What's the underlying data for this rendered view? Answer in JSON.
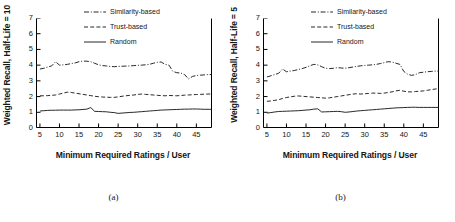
{
  "figure": {
    "panels": [
      {
        "caption": "(a)",
        "chart": {
          "type": "line",
          "title": "",
          "xlabel": "Minimum Required Ratings / User",
          "ylabel": "Weighted Recall, Half-Life = 10",
          "xlim": [
            4,
            49
          ],
          "ylim": [
            0,
            7
          ],
          "xticks": [
            5,
            10,
            15,
            20,
            25,
            30,
            35,
            40,
            45
          ],
          "yticks": [
            0,
            1,
            2,
            3,
            4,
            5,
            6,
            7
          ],
          "grid": false,
          "legend_position": "top-right",
          "x": [
            5,
            6,
            7,
            8,
            9,
            10,
            11,
            12,
            13,
            14,
            15,
            16,
            17,
            18,
            19,
            20,
            21,
            22,
            23,
            24,
            25,
            26,
            27,
            28,
            29,
            30,
            31,
            32,
            33,
            34,
            35,
            36,
            37,
            38,
            39,
            40,
            41,
            42,
            43,
            44,
            45,
            46,
            47,
            48,
            49
          ],
          "series": [
            {
              "name": "Similarity-based",
              "style": "dashdot",
              "values": [
                3.75,
                3.8,
                3.88,
                3.95,
                4.22,
                4.0,
                4.02,
                4.05,
                4.1,
                4.14,
                4.22,
                4.26,
                4.25,
                4.22,
                4.12,
                4.02,
                3.97,
                3.95,
                3.92,
                3.9,
                3.92,
                3.93,
                3.94,
                3.95,
                3.97,
                3.99,
                4.0,
                4.02,
                4.05,
                4.12,
                4.18,
                4.2,
                4.05,
                4.0,
                3.6,
                3.52,
                3.5,
                3.4,
                3.12,
                3.28,
                3.34,
                3.36,
                3.38,
                3.4,
                3.4
              ]
            },
            {
              "name": "Trust-based",
              "style": "dashed",
              "values": [
                2.05,
                2.05,
                2.06,
                2.08,
                2.1,
                2.16,
                2.22,
                2.28,
                2.26,
                2.22,
                2.18,
                2.14,
                2.1,
                2.06,
                2.02,
                1.99,
                1.97,
                1.96,
                1.95,
                1.95,
                1.98,
                2.02,
                2.05,
                2.08,
                2.1,
                2.14,
                2.16,
                2.14,
                2.12,
                2.1,
                2.08,
                2.06,
                2.05,
                2.07,
                2.06,
                2.05,
                2.07,
                2.09,
                2.1,
                2.12,
                2.13,
                2.14,
                2.15,
                2.16,
                2.17
              ]
            },
            {
              "name": "Random",
              "style": "solid",
              "values": [
                1.08,
                1.1,
                1.12,
                1.13,
                1.13,
                1.14,
                1.14,
                1.14,
                1.14,
                1.15,
                1.16,
                1.18,
                1.2,
                1.3,
                1.06,
                1.05,
                1.04,
                1.03,
                1.0,
                0.98,
                0.93,
                0.95,
                0.97,
                0.99,
                1.0,
                1.02,
                1.04,
                1.06,
                1.08,
                1.1,
                1.12,
                1.14,
                1.15,
                1.16,
                1.17,
                1.18,
                1.19,
                1.2,
                1.2,
                1.21,
                1.21,
                1.2,
                1.19,
                1.19,
                1.19
              ]
            }
          ]
        }
      },
      {
        "caption": "(b)",
        "chart": {
          "type": "line",
          "title": "",
          "xlabel": "Minimum Required Ratings / User",
          "ylabel": "Weighted Recall, Half-Life = 5",
          "xlim": [
            4,
            49
          ],
          "ylim": [
            0,
            7
          ],
          "xticks": [
            5,
            10,
            15,
            20,
            25,
            30,
            35,
            40,
            45
          ],
          "yticks": [
            0,
            1,
            2,
            3,
            4,
            5,
            6,
            7
          ],
          "grid": false,
          "legend_position": "top-right",
          "x": [
            5,
            6,
            7,
            8,
            9,
            10,
            11,
            12,
            13,
            14,
            15,
            16,
            17,
            18,
            19,
            20,
            21,
            22,
            23,
            24,
            25,
            26,
            27,
            28,
            29,
            30,
            31,
            32,
            33,
            34,
            35,
            36,
            37,
            38,
            39,
            40,
            41,
            42,
            43,
            44,
            45,
            46,
            47,
            48,
            49
          ],
          "series": [
            {
              "name": "Similarity-based",
              "style": "dashdot",
              "values": [
                3.25,
                3.32,
                3.4,
                3.48,
                3.75,
                3.58,
                3.62,
                3.66,
                3.72,
                3.78,
                3.86,
                3.96,
                4.05,
                4.02,
                3.9,
                3.8,
                3.78,
                3.8,
                3.84,
                3.82,
                3.8,
                3.84,
                3.88,
                3.92,
                3.96,
                3.98,
                4.0,
                4.02,
                4.05,
                4.1,
                4.16,
                4.22,
                4.2,
                4.12,
                4.05,
                3.6,
                3.42,
                3.35,
                3.4,
                3.52,
                3.55,
                3.58,
                3.6,
                3.62,
                3.62
              ]
            },
            {
              "name": "Trust-based",
              "style": "dashed",
              "values": [
                1.7,
                1.72,
                1.76,
                1.8,
                1.88,
                1.94,
                1.98,
                2.02,
                2.04,
                2.02,
                2.0,
                1.98,
                1.96,
                1.94,
                1.92,
                1.9,
                1.92,
                1.96,
                2.0,
                2.04,
                2.08,
                2.12,
                2.16,
                2.18,
                2.16,
                2.18,
                2.2,
                2.22,
                2.22,
                2.2,
                2.22,
                2.26,
                2.3,
                2.36,
                2.4,
                2.34,
                2.3,
                2.3,
                2.32,
                2.34,
                2.36,
                2.4,
                2.44,
                2.48,
                2.5
              ]
            },
            {
              "name": "Random",
              "style": "solid",
              "values": [
                0.95,
                0.98,
                1.02,
                1.05,
                1.06,
                1.07,
                1.08,
                1.09,
                1.1,
                1.12,
                1.14,
                1.16,
                1.2,
                1.22,
                1.02,
                1.03,
                1.04,
                1.05,
                1.06,
                1.04,
                1.0,
                1.02,
                1.05,
                1.08,
                1.1,
                1.12,
                1.14,
                1.16,
                1.18,
                1.2,
                1.22,
                1.24,
                1.26,
                1.28,
                1.29,
                1.3,
                1.31,
                1.32,
                1.32,
                1.31,
                1.31,
                1.31,
                1.31,
                1.31,
                1.31
              ]
            }
          ]
        }
      }
    ]
  },
  "chart_data": [
    {
      "type": "line",
      "title": "(a) Weighted Recall, Half-Life = 10",
      "xlabel": "Minimum Required Ratings / User",
      "ylabel": "Weighted Recall, Half-Life = 10",
      "xlim": [
        4,
        49
      ],
      "ylim": [
        0,
        7
      ],
      "xticks": [
        5,
        10,
        15,
        20,
        25,
        30,
        35,
        40,
        45
      ],
      "yticks": [
        0,
        1,
        2,
        3,
        4,
        5,
        6,
        7
      ],
      "grid": false,
      "legend_position": "top-right",
      "x": [
        5,
        6,
        7,
        8,
        9,
        10,
        11,
        12,
        13,
        14,
        15,
        16,
        17,
        18,
        19,
        20,
        21,
        22,
        23,
        24,
        25,
        26,
        27,
        28,
        29,
        30,
        31,
        32,
        33,
        34,
        35,
        36,
        37,
        38,
        39,
        40,
        41,
        42,
        43,
        44,
        45,
        46,
        47,
        48,
        49
      ],
      "series": [
        {
          "name": "Similarity-based",
          "values": [
            3.75,
            3.8,
            3.88,
            3.95,
            4.22,
            4.0,
            4.02,
            4.05,
            4.1,
            4.14,
            4.22,
            4.26,
            4.25,
            4.22,
            4.12,
            4.02,
            3.97,
            3.95,
            3.92,
            3.9,
            3.92,
            3.93,
            3.94,
            3.95,
            3.97,
            3.99,
            4.0,
            4.02,
            4.05,
            4.12,
            4.18,
            4.2,
            4.05,
            4.0,
            3.6,
            3.52,
            3.5,
            3.4,
            3.12,
            3.28,
            3.34,
            3.36,
            3.38,
            3.4,
            3.4
          ]
        },
        {
          "name": "Trust-based",
          "values": [
            2.05,
            2.05,
            2.06,
            2.08,
            2.1,
            2.16,
            2.22,
            2.28,
            2.26,
            2.22,
            2.18,
            2.14,
            2.1,
            2.06,
            2.02,
            1.99,
            1.97,
            1.96,
            1.95,
            1.95,
            1.98,
            2.02,
            2.05,
            2.08,
            2.1,
            2.14,
            2.16,
            2.14,
            2.12,
            2.1,
            2.08,
            2.06,
            2.05,
            2.07,
            2.06,
            2.05,
            2.07,
            2.09,
            2.1,
            2.12,
            2.13,
            2.14,
            2.15,
            2.16,
            2.17
          ]
        },
        {
          "name": "Random",
          "values": [
            1.08,
            1.1,
            1.12,
            1.13,
            1.13,
            1.14,
            1.14,
            1.14,
            1.14,
            1.15,
            1.16,
            1.18,
            1.2,
            1.3,
            1.06,
            1.05,
            1.04,
            1.03,
            1.0,
            0.98,
            0.93,
            0.95,
            0.97,
            0.99,
            1.0,
            1.02,
            1.04,
            1.06,
            1.08,
            1.1,
            1.12,
            1.14,
            1.15,
            1.16,
            1.17,
            1.18,
            1.19,
            1.2,
            1.2,
            1.21,
            1.21,
            1.2,
            1.19,
            1.19,
            1.19
          ]
        }
      ]
    },
    {
      "type": "line",
      "title": "(b) Weighted Recall, Half-Life = 5",
      "xlabel": "Minimum Required Ratings / User",
      "ylabel": "Weighted Recall, Half-Life = 5",
      "xlim": [
        4,
        49
      ],
      "ylim": [
        0,
        7
      ],
      "xticks": [
        5,
        10,
        15,
        20,
        25,
        30,
        35,
        40,
        45
      ],
      "yticks": [
        0,
        1,
        2,
        3,
        4,
        5,
        6,
        7
      ],
      "grid": false,
      "legend_position": "top-right",
      "x": [
        5,
        6,
        7,
        8,
        9,
        10,
        11,
        12,
        13,
        14,
        15,
        16,
        17,
        18,
        19,
        20,
        21,
        22,
        23,
        24,
        25,
        26,
        27,
        28,
        29,
        30,
        31,
        32,
        33,
        34,
        35,
        36,
        37,
        38,
        39,
        40,
        41,
        42,
        43,
        44,
        45,
        46,
        47,
        48,
        49
      ],
      "series": [
        {
          "name": "Similarity-based",
          "values": [
            3.25,
            3.32,
            3.4,
            3.48,
            3.75,
            3.58,
            3.62,
            3.66,
            3.72,
            3.78,
            3.86,
            3.96,
            4.05,
            4.02,
            3.9,
            3.8,
            3.78,
            3.8,
            3.84,
            3.82,
            3.8,
            3.84,
            3.88,
            3.92,
            3.96,
            3.98,
            4.0,
            4.02,
            4.05,
            4.1,
            4.16,
            4.22,
            4.2,
            4.12,
            4.05,
            3.6,
            3.42,
            3.35,
            3.4,
            3.52,
            3.55,
            3.58,
            3.6,
            3.62,
            3.62
          ]
        },
        {
          "name": "Trust-based",
          "values": [
            1.7,
            1.72,
            1.76,
            1.8,
            1.88,
            1.94,
            1.98,
            2.02,
            2.04,
            2.02,
            2.0,
            1.98,
            1.96,
            1.94,
            1.92,
            1.9,
            1.92,
            1.96,
            2.0,
            2.04,
            2.08,
            2.12,
            2.16,
            2.18,
            2.16,
            2.18,
            2.2,
            2.22,
            2.22,
            2.2,
            2.22,
            2.26,
            2.3,
            2.36,
            2.4,
            2.34,
            2.3,
            2.3,
            2.32,
            2.34,
            2.36,
            2.4,
            2.44,
            2.48,
            2.5
          ]
        },
        {
          "name": "Random",
          "values": [
            0.95,
            0.98,
            1.02,
            1.05,
            1.06,
            1.07,
            1.08,
            1.09,
            1.1,
            1.12,
            1.14,
            1.16,
            1.2,
            1.22,
            1.02,
            1.03,
            1.04,
            1.05,
            1.06,
            1.04,
            1.0,
            1.02,
            1.05,
            1.08,
            1.1,
            1.12,
            1.14,
            1.16,
            1.18,
            1.2,
            1.22,
            1.24,
            1.26,
            1.28,
            1.29,
            1.3,
            1.31,
            1.32,
            1.32,
            1.31,
            1.31,
            1.31,
            1.31,
            1.31,
            1.31
          ]
        }
      ]
    }
  ],
  "colors": {
    "line": "#111111",
    "axis": "#000000",
    "background": "#ffffff"
  }
}
